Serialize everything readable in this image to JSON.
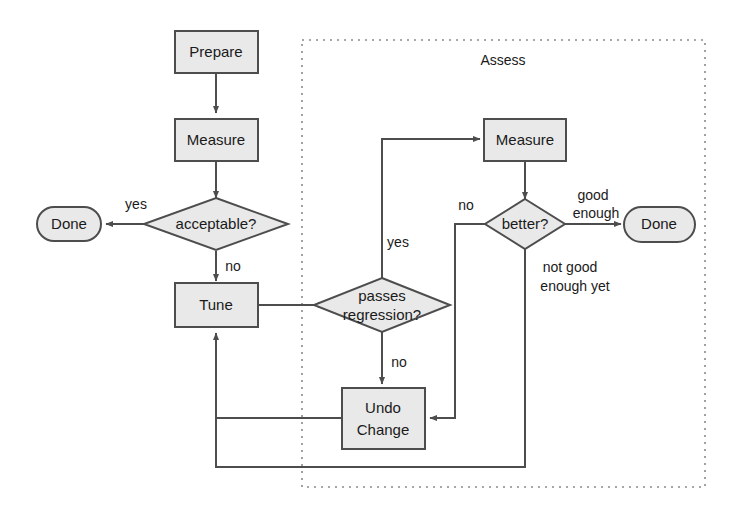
{
  "diagram": {
    "colors": {
      "shape_fill": "#e9e9e9",
      "shape_stroke": "#4d4d4d",
      "edge_stroke": "#4d4d4d",
      "group_stroke": "#8a8a8a",
      "text": "#1a1a1a",
      "background": "#ffffff"
    },
    "group": {
      "label": "Assess"
    },
    "nodes": {
      "prepare": {
        "label": "Prepare",
        "shape": "process"
      },
      "measure_left": {
        "label": "Measure",
        "shape": "process"
      },
      "acceptable": {
        "label": "acceptable?",
        "shape": "decision"
      },
      "done_left": {
        "label": "Done",
        "shape": "terminator"
      },
      "tune": {
        "label": "Tune",
        "shape": "process"
      },
      "passes_regression_line1": {
        "label": "passes",
        "shape": "decision"
      },
      "passes_regression_line2": {
        "label": "regression?",
        "shape": "decision"
      },
      "measure_right": {
        "label": "Measure",
        "shape": "process"
      },
      "better": {
        "label": "better?",
        "shape": "decision"
      },
      "done_right": {
        "label": "Done",
        "shape": "terminator"
      },
      "undo_change_line1": {
        "label": "Undo",
        "shape": "process"
      },
      "undo_change_line2": {
        "label": "Change",
        "shape": "process"
      }
    },
    "edge_labels": {
      "acceptable_yes": "yes",
      "acceptable_no": "no",
      "regression_yes": "yes",
      "regression_no": "no",
      "better_no": "no",
      "better_good_enough_line1": "good",
      "better_good_enough_line2": "enough",
      "better_not_good_line1": "not good",
      "better_not_good_line2": "enough yet"
    }
  }
}
